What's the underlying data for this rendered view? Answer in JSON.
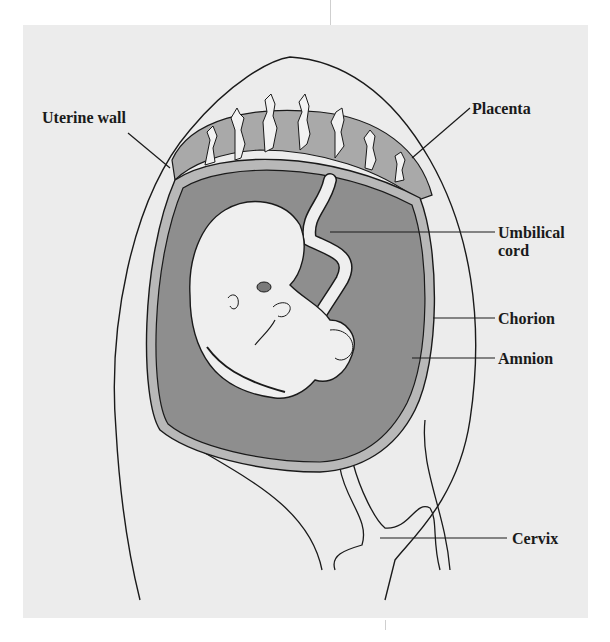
{
  "figure": {
    "labels": [
      {
        "id": "uterine-wall",
        "text": "Uterine wall"
      },
      {
        "id": "placenta",
        "text": "Placenta"
      },
      {
        "id": "umbilical-cord",
        "text": "Umbilical\ncord",
        "line1": "Umbilical",
        "line2": "cord"
      },
      {
        "id": "chorion",
        "text": "Chorion"
      },
      {
        "id": "amnion",
        "text": "Amnion"
      },
      {
        "id": "cervix",
        "text": "Cervix"
      }
    ]
  },
  "colors": {
    "page_background": "#ffffff",
    "panel_background": "#ececec",
    "placenta_fill": "#a9a9a9",
    "amniotic_fluid_fill": "#8e8e8e",
    "membrane_fill": "#b8b8b8",
    "embryo_fill": "#efefef",
    "outline": "#1a1a1a"
  }
}
